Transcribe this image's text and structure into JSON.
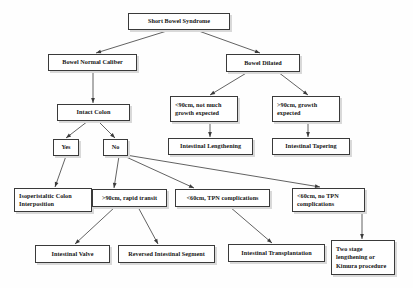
{
  "diagram": {
    "title_node": "Short Bowel Syndrome",
    "type": "flowchart",
    "nodes": [
      {
        "id": "sbs",
        "label": "Short Bowel Syndrome",
        "x": 128,
        "y": 13,
        "w": 102,
        "h": 17,
        "align": "center"
      },
      {
        "id": "normal",
        "label": "Bowel Normal Caliber",
        "x": 48,
        "y": 54,
        "w": 89,
        "h": 17,
        "align": "center"
      },
      {
        "id": "dilated",
        "label": "Bowel Dilated",
        "x": 226,
        "y": 54,
        "w": 74,
        "h": 18,
        "align": "center"
      },
      {
        "id": "lt90",
        "label": "<90cm, not much growth expected",
        "x": 170,
        "y": 96,
        "w": 68,
        "h": 26,
        "align": "left"
      },
      {
        "id": "gt90",
        "label": ">90cm, growth expected",
        "x": 272,
        "y": 96,
        "w": 68,
        "h": 26,
        "align": "left"
      },
      {
        "id": "intact",
        "label": "Intact Colon",
        "x": 57,
        "y": 104,
        "w": 73,
        "h": 17,
        "align": "center"
      },
      {
        "id": "lengthen",
        "label": "Intestinal Lengthening",
        "x": 168,
        "y": 138,
        "w": 85,
        "h": 17,
        "align": "center"
      },
      {
        "id": "taper",
        "label": "Intestinal Tapering",
        "x": 272,
        "y": 138,
        "w": 78,
        "h": 17,
        "align": "center"
      },
      {
        "id": "yes",
        "label": "Yes",
        "x": 53,
        "y": 139,
        "w": 26,
        "h": 17,
        "align": "center"
      },
      {
        "id": "no",
        "label": "No",
        "x": 103,
        "y": 139,
        "w": 25,
        "h": 17,
        "align": "center"
      },
      {
        "id": "isoperi",
        "label": "Isoperistaltic Colon Interposition",
        "x": 14,
        "y": 188,
        "w": 78,
        "h": 24,
        "align": "left"
      },
      {
        "id": "rapid",
        "label": ">90cm, rapid transit",
        "x": 92,
        "y": 189,
        "w": 75,
        "h": 18,
        "align": "center"
      },
      {
        "id": "tpn",
        "label": "<60cm, TPN complications",
        "x": 175,
        "y": 189,
        "w": 95,
        "h": 18,
        "align": "center"
      },
      {
        "id": "notpn",
        "label": "<60cm, no TPN complications",
        "x": 292,
        "y": 188,
        "w": 73,
        "h": 24,
        "align": "left"
      },
      {
        "id": "valve",
        "label": "Intestinal Valve",
        "x": 35,
        "y": 245,
        "w": 75,
        "h": 18,
        "align": "center"
      },
      {
        "id": "reversed",
        "label": "Reversed Intestinal Segment",
        "x": 118,
        "y": 245,
        "w": 97,
        "h": 18,
        "align": "center"
      },
      {
        "id": "transplant",
        "label": "Intestinal Transplantation",
        "x": 228,
        "y": 244,
        "w": 97,
        "h": 18,
        "align": "center"
      },
      {
        "id": "twostage",
        "label": "Two stage lengthening or Kimura procedure",
        "x": 331,
        "y": 240,
        "w": 64,
        "h": 35,
        "align": "left"
      }
    ],
    "edges": [
      {
        "from": "sbs",
        "to": "normal",
        "x1": 170,
        "y1": 30,
        "x2": 96,
        "y2": 53
      },
      {
        "from": "sbs",
        "to": "dilated",
        "x1": 196,
        "y1": 30,
        "x2": 260,
        "y2": 53
      },
      {
        "from": "normal",
        "to": "intact",
        "x1": 93,
        "y1": 71,
        "x2": 93,
        "y2": 103
      },
      {
        "from": "dilated",
        "to": "lt90",
        "x1": 248,
        "y1": 72,
        "x2": 210,
        "y2": 95
      },
      {
        "from": "dilated",
        "to": "gt90",
        "x1": 278,
        "y1": 72,
        "x2": 308,
        "y2": 95
      },
      {
        "from": "lt90",
        "to": "lengthen",
        "x1": 210,
        "y1": 122,
        "x2": 210,
        "y2": 137
      },
      {
        "from": "gt90",
        "to": "taper",
        "x1": 308,
        "y1": 122,
        "x2": 308,
        "y2": 137
      },
      {
        "from": "intact",
        "to": "yes",
        "x1": 88,
        "y1": 121,
        "x2": 66,
        "y2": 138
      },
      {
        "from": "intact",
        "to": "no",
        "x1": 98,
        "y1": 121,
        "x2": 115,
        "y2": 138
      },
      {
        "from": "yes",
        "to": "isoperi",
        "x1": 66,
        "y1": 156,
        "x2": 55,
        "y2": 187
      },
      {
        "from": "no",
        "to": "rapid",
        "x1": 119,
        "y1": 156,
        "x2": 114,
        "y2": 188
      },
      {
        "from": "no",
        "to": "tpn",
        "x1": 124,
        "y1": 156,
        "x2": 194,
        "y2": 188
      },
      {
        "from": "no",
        "to": "notpn",
        "x1": 126,
        "y1": 155,
        "x2": 320,
        "y2": 187
      },
      {
        "from": "rapid",
        "to": "valve",
        "x1": 115,
        "y1": 207,
        "x2": 75,
        "y2": 244
      },
      {
        "from": "rapid",
        "to": "reversed",
        "x1": 138,
        "y1": 207,
        "x2": 158,
        "y2": 244
      },
      {
        "from": "tpn",
        "to": "transplant",
        "x1": 230,
        "y1": 207,
        "x2": 272,
        "y2": 243
      },
      {
        "from": "notpn",
        "to": "twostage",
        "x1": 362,
        "y1": 212,
        "x2": 362,
        "y2": 239
      }
    ],
    "style": {
      "stroke": "#3a3a3a",
      "box_border": "#3a3a3a",
      "box_fill": "#ffffff",
      "text": "#141414",
      "background": "#fefefe",
      "shadow": "#d9d9d9"
    }
  }
}
